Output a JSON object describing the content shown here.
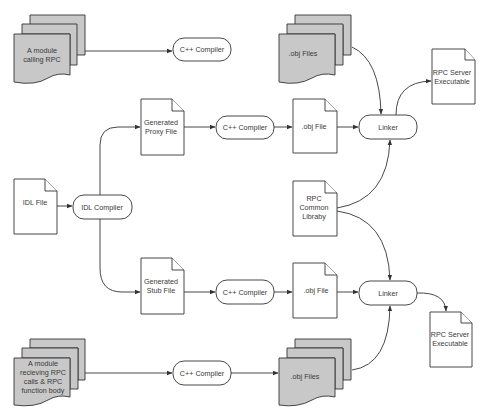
{
  "diagram": {
    "type": "flowchart",
    "title": "",
    "colors": {
      "stroke": "#333333",
      "multi_doc_fill": "#c8c8c8",
      "doc_fill": "#ffffff",
      "text": "#3a3a3a"
    },
    "nodes": {
      "module_calling_rpc": {
        "shape": "multi-document",
        "lines": [
          "A module",
          "calling RPC"
        ]
      },
      "cpp_compiler_top": {
        "shape": "terminator",
        "label": "C++ Compiler"
      },
      "obj_files_top": {
        "shape": "multi-document",
        "lines": [
          ".obj Files"
        ]
      },
      "rpc_server_exe_top": {
        "shape": "document",
        "lines": [
          "RPC Server",
          "Executable"
        ]
      },
      "generated_proxy_file": {
        "shape": "document",
        "lines": [
          "Generated",
          "Proxy File"
        ]
      },
      "cpp_compiler_proxy": {
        "shape": "terminator",
        "label": "C++ Compiler"
      },
      "obj_file_proxy": {
        "shape": "document",
        "lines": [
          ".obj File"
        ]
      },
      "linker_top": {
        "shape": "terminator",
        "label": "Linker"
      },
      "idl_file": {
        "shape": "document",
        "lines": [
          "IDL File"
        ]
      },
      "idl_compiler": {
        "shape": "terminator",
        "label": "IDL Compiler"
      },
      "rpc_common_library": {
        "shape": "document",
        "lines": [
          "RPC",
          "Common",
          "Libraby"
        ]
      },
      "generated_stub_file": {
        "shape": "document",
        "lines": [
          "Generated",
          "Stub File"
        ]
      },
      "cpp_compiler_stub": {
        "shape": "terminator",
        "label": "C++ Compiler"
      },
      "obj_file_stub": {
        "shape": "document",
        "lines": [
          ".obj File"
        ]
      },
      "linker_bottom": {
        "shape": "terminator",
        "label": "Linker"
      },
      "rpc_server_exe_bottom": {
        "shape": "document",
        "lines": [
          "RPC Server",
          "Executable"
        ]
      },
      "module_receiving_rpc": {
        "shape": "multi-document",
        "lines": [
          "A module",
          "recieving RPC",
          "calls & RPC",
          "function body"
        ]
      },
      "cpp_compiler_bottom": {
        "shape": "terminator",
        "label": "C++ Compiler"
      },
      "obj_files_bottom": {
        "shape": "multi-document",
        "lines": [
          ".obj Files"
        ]
      }
    },
    "edges": [
      {
        "from": "module_calling_rpc",
        "to": "cpp_compiler_top"
      },
      {
        "from": "idl_file",
        "to": "idl_compiler"
      },
      {
        "from": "idl_compiler",
        "to": "generated_proxy_file"
      },
      {
        "from": "idl_compiler",
        "to": "generated_stub_file"
      },
      {
        "from": "generated_proxy_file",
        "to": "cpp_compiler_proxy"
      },
      {
        "from": "cpp_compiler_proxy",
        "to": "obj_file_proxy"
      },
      {
        "from": "obj_file_proxy",
        "to": "linker_top"
      },
      {
        "from": "obj_files_top",
        "to": "linker_top"
      },
      {
        "from": "rpc_common_library",
        "to": "linker_top"
      },
      {
        "from": "linker_top",
        "to": "rpc_server_exe_top"
      },
      {
        "from": "generated_stub_file",
        "to": "cpp_compiler_stub"
      },
      {
        "from": "cpp_compiler_stub",
        "to": "obj_file_stub"
      },
      {
        "from": "obj_file_stub",
        "to": "linker_bottom"
      },
      {
        "from": "rpc_common_library",
        "to": "linker_bottom"
      },
      {
        "from": "obj_files_bottom",
        "to": "linker_bottom"
      },
      {
        "from": "linker_bottom",
        "to": "rpc_server_exe_bottom"
      },
      {
        "from": "module_receiving_rpc",
        "to": "cpp_compiler_bottom"
      },
      {
        "from": "cpp_compiler_bottom",
        "to": "obj_files_bottom"
      }
    ]
  }
}
